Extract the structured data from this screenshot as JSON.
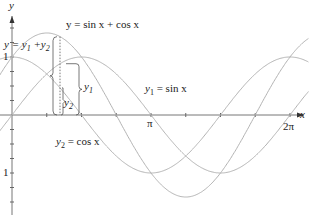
{
  "chart_data": {
    "type": "line",
    "title": "",
    "xlabel": "x",
    "ylabel": "y",
    "xlim": [
      -0.785,
      6.6
    ],
    "ylim": [
      -1.45,
      1.65
    ],
    "x_ticks": [
      "π/4",
      "π/2",
      "3π/4",
      "π",
      "5π/4",
      "3π/2",
      "7π/4",
      "2π"
    ],
    "x_tick_labels": {
      "pi": "π",
      "two_pi": "2π"
    },
    "y_tick_labels": {
      "pos": "1",
      "neg": "1"
    },
    "series": [
      {
        "name": "y1 = sin x",
        "function": "sin(x)",
        "color": "#b3b3b3"
      },
      {
        "name": "y2 = cos x",
        "function": "cos(x)",
        "color": "#b3b3b3"
      },
      {
        "name": "y = sin x + cos x",
        "function": "sin(x)+cos(x)",
        "color": "#b3b3b3"
      }
    ],
    "annotations": [
      {
        "text": "y = sin x + cos x"
      },
      {
        "text": "y = y1 + y2"
      },
      {
        "text": "y1"
      },
      {
        "text": "y2"
      },
      {
        "text": "y1 = sin x"
      },
      {
        "text": "y2 = cos x"
      }
    ],
    "legend": "none",
    "grid": false
  },
  "labels": {
    "y_axis": "y",
    "x_axis": "x",
    "sum_eq": "y = sin x + cos x",
    "sum_def": "y = y",
    "sub1": "1",
    "plus": " +y",
    "sub2": "2",
    "one_pos": "1",
    "one_neg": "1",
    "pi": "π",
    "two_pi": "2π",
    "y1_a": "y",
    "y2_a": "y",
    "sin_lbl_y": "y",
    "sin_lbl_rest": " = sin x",
    "cos_lbl_y": "y",
    "cos_lbl_rest": " = cos x"
  }
}
